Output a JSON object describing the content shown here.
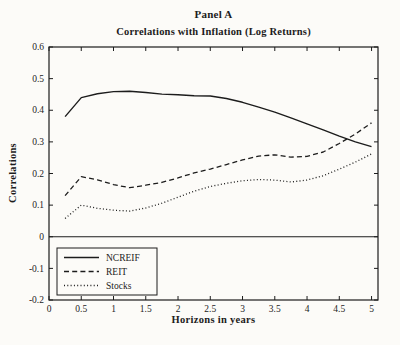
{
  "figure": {
    "panel_label": "Panel A",
    "title": "Correlations with Inflation (Log Returns)",
    "xlabel": "Horizons in years",
    "ylabel": "Correlations"
  },
  "chart_data": {
    "type": "line",
    "title": "Panel A",
    "subtitle": "Correlations with Inflation (Log Returns)",
    "xlabel": "Horizons in years",
    "ylabel": "Correlations",
    "xlim": [
      0,
      5.1
    ],
    "ylim": [
      -0.2,
      0.6
    ],
    "x_ticks": [
      0,
      0.5,
      1,
      1.5,
      2,
      2.5,
      3,
      3.5,
      4,
      4.5,
      5
    ],
    "x_tick_labels": [
      "0",
      "0.5",
      "1",
      "1.5",
      "2",
      "2.5",
      "3",
      "3.5",
      "4",
      "4.5",
      "5"
    ],
    "y_ticks": [
      -0.2,
      -0.1,
      0,
      0.1,
      0.2,
      0.3,
      0.4,
      0.5,
      0.6
    ],
    "y_tick_labels": [
      "-0.2",
      "-0.1",
      "0",
      "0.1",
      "0.2",
      "0.3",
      "0.4",
      "0.5",
      "0.6"
    ],
    "grid": false,
    "zero_line": true,
    "legend_position": "lower left",
    "line_color": "#1c1c1c",
    "x": [
      0.25,
      0.5,
      0.75,
      1,
      1.25,
      1.5,
      1.75,
      2,
      2.25,
      2.5,
      2.75,
      3,
      3.25,
      3.5,
      3.75,
      4,
      4.25,
      4.5,
      4.75,
      5
    ],
    "series": [
      {
        "name": "NCREIF",
        "line_style": "solid",
        "values": [
          0.38,
          0.44,
          0.452,
          0.459,
          0.46,
          0.456,
          0.451,
          0.449,
          0.446,
          0.445,
          0.437,
          0.425,
          0.41,
          0.394,
          0.376,
          0.357,
          0.338,
          0.318,
          0.3,
          0.285
        ]
      },
      {
        "name": "REIT",
        "line_style": "dashed",
        "values": [
          0.13,
          0.19,
          0.18,
          0.165,
          0.155,
          0.163,
          0.172,
          0.186,
          0.202,
          0.214,
          0.228,
          0.243,
          0.255,
          0.259,
          0.252,
          0.254,
          0.268,
          0.295,
          0.325,
          0.36
        ]
      },
      {
        "name": "Stocks",
        "line_style": "dotted",
        "values": [
          0.058,
          0.1,
          0.09,
          0.084,
          0.081,
          0.091,
          0.106,
          0.125,
          0.144,
          0.159,
          0.169,
          0.177,
          0.181,
          0.179,
          0.173,
          0.179,
          0.193,
          0.214,
          0.236,
          0.262
        ]
      }
    ]
  }
}
